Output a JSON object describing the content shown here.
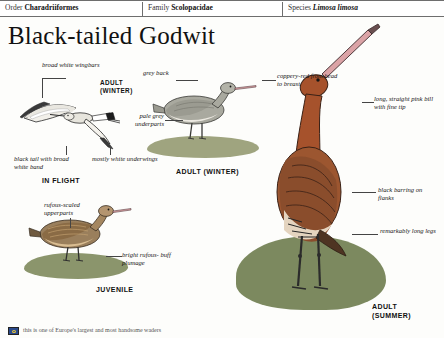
{
  "taxonomy": {
    "order_label": "Order",
    "order_value": "Charadriiformes",
    "family_label": "Family",
    "family_value": "Scolopacidae",
    "species_label": "Species",
    "species_value": "Limosa limosa"
  },
  "title": "Black-tailed Godwit",
  "annotations": {
    "broad_white_wingbars": "broad white\nwingbars",
    "grey_back": "grey back",
    "pale_grey_underparts": "pale grey\nunderparts",
    "black_tail": "black tail with\nbroad white band",
    "mostly_white_underwings": "mostly white\nunderwings",
    "coppery_red": "coppery-red\nfrom head to\nbreast",
    "long_straight_bill": "long, straight\npink bill with\nfine tip",
    "black_barring": "black barring\non flanks",
    "long_legs": "remarkably\nlong legs",
    "rufous_scaled": "rufous-scaled\nupperparts",
    "buff_plumage": "bright rufous-\nbuff plumage"
  },
  "captions": {
    "adult_winter_inline": "ADULT\n(WINTER)",
    "in_flight": "IN FLIGHT",
    "adult_winter": "ADULT (WINTER)",
    "juvenile": "JUVENILE",
    "adult_summer": "ADULT\n(SUMMER)"
  },
  "footer": {
    "note": "this is one of Europe's largest and most handsome waders"
  },
  "colors": {
    "rule": "#6e6e6e",
    "ink": "#141414",
    "coppery_red": "#a6522c",
    "grey_back": "#9a9a93",
    "bill_pink": "#d99a9e",
    "leg_dark": "#2e2e2e",
    "habitat_green": "#7e8a5c"
  }
}
